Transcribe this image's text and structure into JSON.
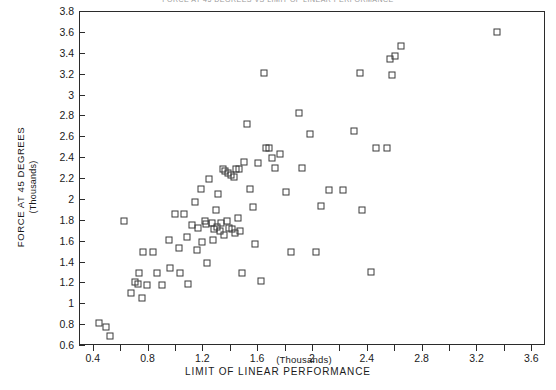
{
  "chart_data": {
    "type": "scatter",
    "title": "FORCE AT 45 DEGREES VS LIMIT OF LINEAR PERFORMANCE",
    "xlabel": "LIMIT OF LINEAR PERFORMANCE",
    "x_units": "(Thousands)",
    "ylabel": "FORCE AT 45 DEGREES",
    "y_units": "(Thousands)",
    "xlim": [
      0.3,
      3.7
    ],
    "ylim": [
      0.6,
      3.8
    ],
    "xticks": [
      0.4,
      0.6,
      0.8,
      1.0,
      1.2,
      1.4,
      1.6,
      1.8,
      2.0,
      2.2,
      2.4,
      2.6,
      2.8,
      3.0,
      3.2,
      3.4,
      3.6
    ],
    "xticklabels": [
      "0.4",
      "",
      "0.8",
      "",
      "1.2",
      "",
      "1.6",
      "",
      "2",
      "",
      "2.4",
      "",
      "2.8",
      "",
      "3.2",
      "",
      "3.6"
    ],
    "yticks": [
      0.6,
      0.8,
      1.0,
      1.2,
      1.4,
      1.6,
      1.8,
      2.0,
      2.2,
      2.4,
      2.6,
      2.8,
      3.0,
      3.2,
      3.4,
      3.6,
      3.8
    ],
    "yticklabels": [
      "0.6",
      "0.8",
      "1",
      "1.2",
      "1.4",
      "1.6",
      "1.8",
      "2",
      "2.2",
      "2.4",
      "2.6",
      "2.8",
      "3",
      "3.2",
      "3.4",
      "3.6",
      "3.8"
    ],
    "grid": false,
    "legend": null,
    "marker": "open-square",
    "marker_color": "#3a3a3a",
    "points": [
      [
        0.44,
        0.82
      ],
      [
        0.49,
        0.78
      ],
      [
        0.52,
        0.7
      ],
      [
        0.62,
        1.8
      ],
      [
        0.67,
        1.11
      ],
      [
        0.7,
        1.21
      ],
      [
        0.72,
        1.19
      ],
      [
        0.73,
        1.3
      ],
      [
        0.75,
        1.06
      ],
      [
        0.76,
        1.5
      ],
      [
        0.79,
        1.18
      ],
      [
        0.83,
        1.5
      ],
      [
        0.86,
        1.3
      ],
      [
        0.9,
        1.18
      ],
      [
        0.95,
        1.62
      ],
      [
        0.96,
        1.35
      ],
      [
        0.99,
        1.86
      ],
      [
        1.02,
        1.54
      ],
      [
        1.03,
        1.3
      ],
      [
        1.06,
        1.86
      ],
      [
        1.08,
        1.64
      ],
      [
        1.09,
        1.19
      ],
      [
        1.12,
        1.76
      ],
      [
        1.14,
        1.98
      ],
      [
        1.15,
        1.52
      ],
      [
        1.16,
        1.73
      ],
      [
        1.18,
        2.1
      ],
      [
        1.19,
        1.6
      ],
      [
        1.21,
        1.8
      ],
      [
        1.22,
        1.77
      ],
      [
        1.23,
        1.4
      ],
      [
        1.24,
        2.2
      ],
      [
        1.26,
        1.78
      ],
      [
        1.27,
        1.62
      ],
      [
        1.28,
        1.72
      ],
      [
        1.29,
        1.9
      ],
      [
        1.3,
        1.74
      ],
      [
        1.31,
        2.06
      ],
      [
        1.32,
        1.7
      ],
      [
        1.33,
        1.78
      ],
      [
        1.34,
        2.3
      ],
      [
        1.35,
        1.66
      ],
      [
        1.36,
        2.28
      ],
      [
        1.37,
        1.8
      ],
      [
        1.38,
        2.26
      ],
      [
        1.39,
        1.73
      ],
      [
        1.4,
        2.24
      ],
      [
        1.41,
        1.72
      ],
      [
        1.42,
        2.22
      ],
      [
        1.43,
        1.68
      ],
      [
        1.44,
        2.3
      ],
      [
        1.45,
        1.83
      ],
      [
        1.46,
        2.3
      ],
      [
        1.47,
        1.7
      ],
      [
        1.48,
        1.3
      ],
      [
        1.5,
        2.36
      ],
      [
        1.52,
        2.73
      ],
      [
        1.54,
        2.1
      ],
      [
        1.56,
        1.93
      ],
      [
        1.58,
        1.58
      ],
      [
        1.6,
        2.35
      ],
      [
        1.62,
        1.22
      ],
      [
        1.64,
        3.22
      ],
      [
        1.66,
        2.5
      ],
      [
        1.68,
        2.5
      ],
      [
        1.7,
        2.4
      ],
      [
        1.72,
        2.31
      ],
      [
        1.76,
        2.44
      ],
      [
        1.8,
        2.08
      ],
      [
        1.84,
        1.5
      ],
      [
        1.9,
        2.83
      ],
      [
        1.92,
        2.31
      ],
      [
        1.98,
        2.63
      ],
      [
        2.02,
        1.5
      ],
      [
        2.06,
        1.94
      ],
      [
        2.12,
        2.09
      ],
      [
        2.22,
        2.09
      ],
      [
        2.3,
        2.66
      ],
      [
        2.34,
        3.22
      ],
      [
        2.36,
        1.9
      ],
      [
        2.42,
        1.31
      ],
      [
        2.46,
        2.5
      ],
      [
        2.54,
        2.5
      ],
      [
        2.56,
        3.35
      ],
      [
        2.58,
        3.2
      ],
      [
        2.6,
        3.38
      ],
      [
        2.64,
        3.47
      ],
      [
        3.34,
        3.61
      ]
    ]
  }
}
